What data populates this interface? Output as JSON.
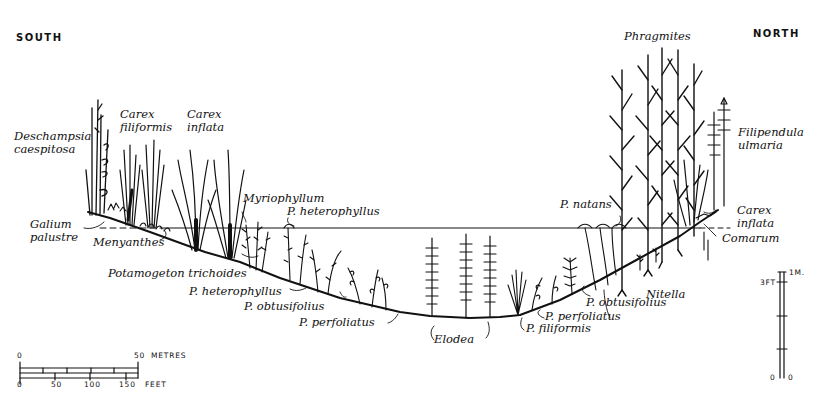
{
  "orientation": {
    "left": "SOUTH",
    "right": "NORTH"
  },
  "labels": {
    "deschampsia_1": "Deschampsia",
    "deschampsia_2": "caespitosa",
    "carex_filiformis_1": "Carex",
    "carex_filiformis_2": "filiformis",
    "carex_inflata_left_1": "Carex",
    "carex_inflata_left_2": "inflata",
    "galium_1": "Galium",
    "galium_2": "palustre",
    "menyanthes": "Menyanthes",
    "myriophyllum": "Myriophyllum",
    "p_heterophyllus_top": "P. heterophyllus",
    "potamogeton_trichoides": "Potamogeton trichoides",
    "p_heterophyllus_low": "P. heterophyllus",
    "p_obtusifolius_left": "P. obtusifolius",
    "p_perfoliatus_left": "P. perfoliatus",
    "elodea": "Elodea",
    "p_filiformis": "P. filiformis",
    "p_perfoliatus_right": "P. perfoliatus",
    "p_obtusifolius_right": "P. obtusifolius",
    "nitella": "Nitella",
    "p_natans": "P. natans",
    "phragmites": "Phragmites",
    "filipendula_1": "Filipendula",
    "filipendula_2": "ulmaria",
    "carex_inflata_right_1": "Carex",
    "carex_inflata_right_2": "inflata",
    "comarum": "Comarum"
  },
  "horizontal_scale": {
    "metres_zero": "0",
    "metres_max": "50",
    "metres_unit": "METRES",
    "feet_ticks": [
      "0",
      "50",
      "100",
      "150"
    ],
    "feet_unit": "FEET"
  },
  "vertical_scale": {
    "top_metric": "1M.",
    "feet_mark": "3FT",
    "zero_left": "0",
    "zero_right": "0"
  }
}
